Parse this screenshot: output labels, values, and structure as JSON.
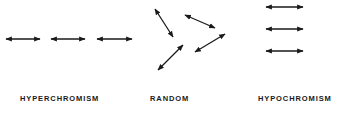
{
  "diagram": {
    "arrow_color": "#1a1a1a",
    "panels": [
      {
        "label": "HYPERCHROMISM",
        "arrows": [
          {
            "x1": 6,
            "y1": 39,
            "x2": 40,
            "y2": 39
          },
          {
            "x1": 51,
            "y1": 39,
            "x2": 85,
            "y2": 39
          },
          {
            "x1": 97,
            "y1": 39,
            "x2": 132,
            "y2": 39
          }
        ]
      },
      {
        "label": "RANDOM",
        "arrows": [
          {
            "x1": 155,
            "y1": 9,
            "x2": 173,
            "y2": 37
          },
          {
            "x1": 185,
            "y1": 15,
            "x2": 215,
            "y2": 28
          },
          {
            "x1": 183,
            "y1": 45,
            "x2": 158,
            "y2": 70
          },
          {
            "x1": 225,
            "y1": 34,
            "x2": 195,
            "y2": 52
          }
        ]
      },
      {
        "label": "HYPOCHROMISM",
        "arrows": [
          {
            "x1": 266,
            "y1": 7,
            "x2": 303,
            "y2": 7
          },
          {
            "x1": 266,
            "y1": 29,
            "x2": 303,
            "y2": 29
          },
          {
            "x1": 266,
            "y1": 51,
            "x2": 303,
            "y2": 51
          }
        ]
      }
    ]
  }
}
